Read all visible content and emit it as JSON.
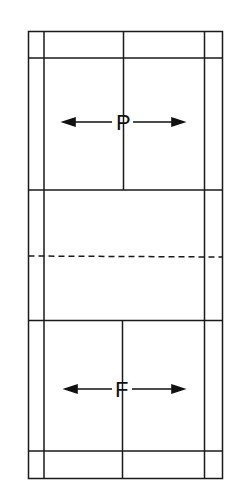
{
  "diagram": {
    "type": "badminton-court",
    "labels": {
      "top_player": "P",
      "bottom_player": "F"
    },
    "colors": {
      "line": "#1a1a1a",
      "background": "#ffffff"
    },
    "arrows": {
      "top": [
        "left",
        "right"
      ],
      "bottom": [
        "left",
        "right"
      ]
    }
  }
}
